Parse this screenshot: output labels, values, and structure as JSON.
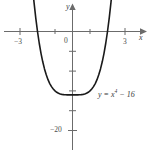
{
  "chart_data": {
    "type": "line",
    "title": "",
    "subtitle": "",
    "xlabel": "x",
    "ylabel": "y",
    "grid": false,
    "legend_position": "inline-annotation",
    "xlim": [
      -4.1,
      4.4
    ],
    "ylim": [
      -24,
      7
    ],
    "x_ticks": [
      -3,
      -2,
      -1,
      0,
      1,
      2,
      3
    ],
    "x_tick_labels": [
      "-3",
      "",
      "",
      "0",
      "",
      "",
      "3"
    ],
    "y_ticks": [
      -20,
      -15,
      -10,
      -5,
      0
    ],
    "y_tick_labels": [
      "-20",
      "",
      "",
      "",
      ""
    ],
    "annotations": [
      {
        "text": "y = x^4 - 16",
        "text_plain": "y = x",
        "exponent": "4",
        "text_tail": " − 16",
        "x": 1.5,
        "y": -13
      }
    ],
    "series": [
      {
        "name": "y = x^4 - 16",
        "color": "#1a1a1a",
        "x": [
          -2.45,
          -2.4,
          -2.3,
          -2.2,
          -2.1,
          -2.0,
          -1.9,
          -1.8,
          -1.7,
          -1.6,
          -1.5,
          -1.4,
          -1.3,
          -1.2,
          -1.1,
          -1.0,
          -0.9,
          -0.8,
          -0.7,
          -0.6,
          -0.5,
          -0.4,
          -0.3,
          -0.2,
          -0.1,
          0.0,
          0.1,
          0.2,
          0.3,
          0.4,
          0.5,
          0.6,
          0.7,
          0.8,
          0.9,
          1.0,
          1.1,
          1.2,
          1.3,
          1.4,
          1.5,
          1.6,
          1.7,
          1.8,
          1.9,
          2.0,
          2.1,
          2.2,
          2.3,
          2.4,
          2.45
        ],
        "y": [
          20.0,
          17.2,
          11.99,
          7.43,
          3.45,
          0.0,
          -2.96,
          -5.5,
          -7.65,
          -9.45,
          -10.94,
          -6.16,
          -13.14,
          -13.93,
          -14.54,
          -15.0,
          -15.34,
          -15.59,
          -15.76,
          -15.87,
          -15.94,
          -15.97,
          -15.99,
          -16.0,
          -16.0,
          -16.0,
          -16.0,
          -16.0,
          -15.99,
          -15.97,
          -15.94,
          -15.87,
          -15.76,
          -15.59,
          -15.34,
          -15.0,
          -14.54,
          -13.93,
          -13.14,
          -12.16,
          -10.94,
          -9.45,
          -7.65,
          -5.5,
          -2.96,
          0.0,
          3.45,
          7.43,
          11.99,
          17.2,
          20.0
        ]
      }
    ],
    "roots": [
      -2,
      2
    ],
    "minimum": {
      "x": 0,
      "y": -16
    }
  },
  "axis": {
    "x_label": "x",
    "y_label": "y",
    "origin_label": "0"
  },
  "labels": {
    "x_neg3": "−3",
    "x_pos3": "3",
    "y_neg20": "−20",
    "equation_lhs": "y = x",
    "equation_exp": "4",
    "equation_rhs": " − 16"
  },
  "colors": {
    "curve": "#1a1a1a",
    "axis": "#6b6b6b",
    "text": "#3b3b3b",
    "background": "#ffffff"
  }
}
